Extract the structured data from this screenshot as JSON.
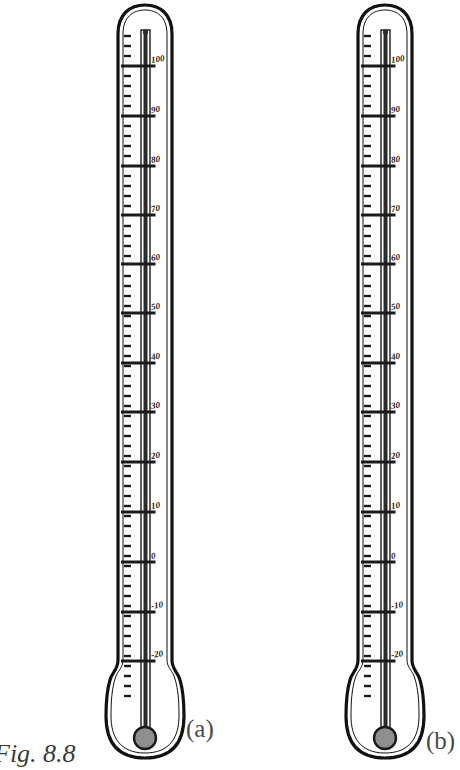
{
  "figure": {
    "caption": "Fig. 8.8"
  },
  "colors": {
    "ink": "#1a1a1a",
    "glass_outline": "#111111",
    "bulb_fill": "#8f8f8f",
    "capillary_fill": "#2b2b2b",
    "caption": "#3a3a3a",
    "paper": "#ffffff"
  },
  "panels": [
    {
      "id": "a",
      "label": "(a)",
      "label_x": 186,
      "label_y": 737,
      "body_left": 118,
      "body_right": 172,
      "mercury_top_y": 30,
      "mercury_reading": 100
    },
    {
      "id": "b",
      "label": "(b)",
      "label_x": 412,
      "label_y": 749,
      "body_left": 358,
      "body_right": 412,
      "mercury_top_y": 30,
      "mercury_reading": 100
    }
  ],
  "scale": {
    "unit_label": "",
    "major_labels": [
      "100",
      "90",
      "80",
      "70",
      "60",
      "50",
      "40",
      "30",
      "20",
      "10",
      "0",
      "-10",
      "-20"
    ],
    "major_values": [
      100,
      90,
      80,
      70,
      60,
      50,
      40,
      30,
      20,
      10,
      0,
      -10,
      -20
    ],
    "major_y": [
      66,
      116,
      166,
      215,
      264,
      313,
      363,
      412,
      462,
      512,
      562,
      612,
      661
    ],
    "minor_ticks_between_majors": 4,
    "minor_tick_spacing_px": 10,
    "first_minor_y": 36,
    "last_minor_y": 700,
    "top_value": 110,
    "bottom_value": -30
  },
  "geometry": {
    "canvas_width": 460,
    "canvas_height": 770,
    "stem_top_y": 6,
    "stem_bottom_y": 672,
    "neck_y": 676,
    "bulb_body_top_y": 684,
    "bulb_body_bottom_y": 758,
    "bulb_circle_cy": 738,
    "bulb_circle_r": 11,
    "capillary_half_width": 4
  }
}
